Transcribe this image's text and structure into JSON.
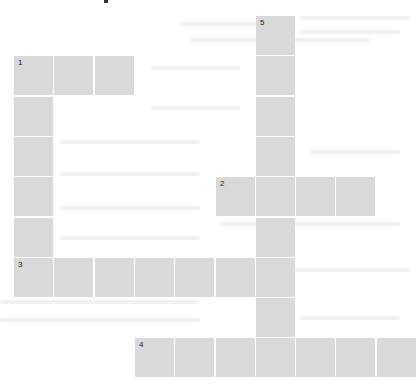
{
  "puzzle": {
    "type": "crossword",
    "cell_color": "#d9d9d9",
    "background": "#ffffff",
    "cell_pitch_px": 40.3,
    "words": [
      {
        "number": "1",
        "direction": "across",
        "row": 1,
        "col": 0,
        "length": 3
      },
      {
        "number": "1",
        "direction": "down",
        "row": 1,
        "col": 0,
        "length": 6
      },
      {
        "number": "2",
        "direction": "across",
        "row": 4,
        "col": 5,
        "length": 4
      },
      {
        "number": "3",
        "direction": "across",
        "row": 6,
        "col": 0,
        "length": 7
      },
      {
        "number": "4",
        "direction": "across",
        "row": 8,
        "col": 3,
        "length": 7
      },
      {
        "number": "5",
        "direction": "down",
        "row": 0,
        "col": 6,
        "length": 9
      }
    ]
  }
}
